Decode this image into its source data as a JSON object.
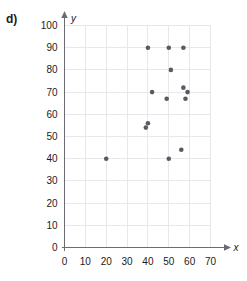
{
  "panel": {
    "label": "d)"
  },
  "colors": {
    "point": "#5a5a60",
    "grid": "#e8e8ec",
    "axis": "#6b6b73",
    "text": "#1b1b1b",
    "background": "#ffffff"
  },
  "chart_data": {
    "type": "scatter",
    "title": "",
    "xlabel": "x",
    "ylabel": "y",
    "xlim": [
      0,
      70
    ],
    "ylim": [
      0,
      100
    ],
    "xticks": [
      0,
      10,
      20,
      30,
      40,
      50,
      60,
      70
    ],
    "yticks": [
      0,
      10,
      20,
      30,
      40,
      50,
      60,
      70,
      80,
      90,
      100
    ],
    "xtick_labels": [
      "0",
      "10",
      "20",
      "30",
      "40",
      "50",
      "60",
      "70"
    ],
    "ytick_labels": [
      "0",
      "10",
      "20",
      "30",
      "40",
      "50",
      "60",
      "70",
      "80",
      "90",
      "100"
    ],
    "grid": true,
    "legend": false,
    "points": [
      {
        "x": 20,
        "y": 40
      },
      {
        "x": 39,
        "y": 54
      },
      {
        "x": 40,
        "y": 56
      },
      {
        "x": 40,
        "y": 90
      },
      {
        "x": 42,
        "y": 70
      },
      {
        "x": 49,
        "y": 67
      },
      {
        "x": 50,
        "y": 40
      },
      {
        "x": 50,
        "y": 90
      },
      {
        "x": 51,
        "y": 80
      },
      {
        "x": 56,
        "y": 44
      },
      {
        "x": 57,
        "y": 72
      },
      {
        "x": 57,
        "y": 90
      },
      {
        "x": 58,
        "y": 67
      },
      {
        "x": 59,
        "y": 70
      }
    ]
  }
}
